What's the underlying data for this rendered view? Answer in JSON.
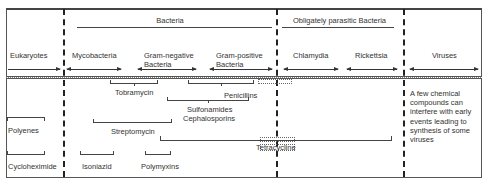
{
  "header": {
    "group_bacteria": "Bacteria",
    "group_obligately_parasitic": "Obligately parasitic Bacteria"
  },
  "columns": [
    {
      "id": "eukaryotes",
      "label": "Eukaryotes"
    },
    {
      "id": "mycobacteria",
      "label": "Mycobacteria"
    },
    {
      "id": "gram-negative",
      "label_line1": "Gram-negative",
      "label_line2": "Bacteria"
    },
    {
      "id": "gram-positive",
      "label_line1": "Gram-positive",
      "label_line2": "Bacteria"
    },
    {
      "id": "chlamydia",
      "label": "Chlamydia"
    },
    {
      "id": "rickettsia",
      "label": "Rickettsia"
    },
    {
      "id": "viruses",
      "label": "Viruses"
    }
  ],
  "drugs": {
    "tobramycin": "Tobramycin",
    "penicillins": "Penicillins",
    "sulfonamides": "Sulfonamides",
    "cephalosporins": "Cephalosporins",
    "polyenes": "Polyenes",
    "streptomycin": "Streptomycin",
    "tetracycline": "Tetracycline",
    "cycloheximide": "Cycloheximide",
    "isoniazid": "Isoniazid",
    "polymyxins": "Polymyxins"
  },
  "virus_note": "A few chemical compounds can interfere with early events leading to synthesis of some viruses"
}
